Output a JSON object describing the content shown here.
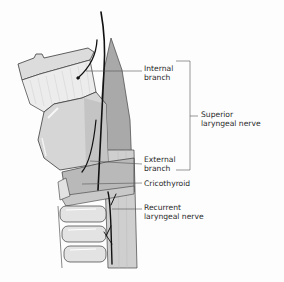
{
  "figure": {
    "labels": {
      "internal_branch": {
        "line1": "Internal",
        "line2": "branch"
      },
      "external_branch": {
        "line1": "External",
        "line2": "branch"
      },
      "superior_laryngeal_nerve": {
        "line1": "Superior",
        "line2": "laryngeal nerve"
      },
      "cricothyroid": {
        "line1": "Cricothyroid"
      },
      "recurrent_laryngeal_nerve": {
        "line1": "Recurrent",
        "line2": "laryngeal nerve"
      }
    },
    "colors": {
      "background": "#fdfdfd",
      "cartilage_light": "#e4e4e4",
      "cartilage_mid": "#d2d2d2",
      "muscle_shade": "#bdbdbd",
      "pharynx_shade": "#a8a8a8",
      "outline": "#3a3a3a",
      "nerve": "#111111",
      "leader_line": "#555555"
    }
  }
}
